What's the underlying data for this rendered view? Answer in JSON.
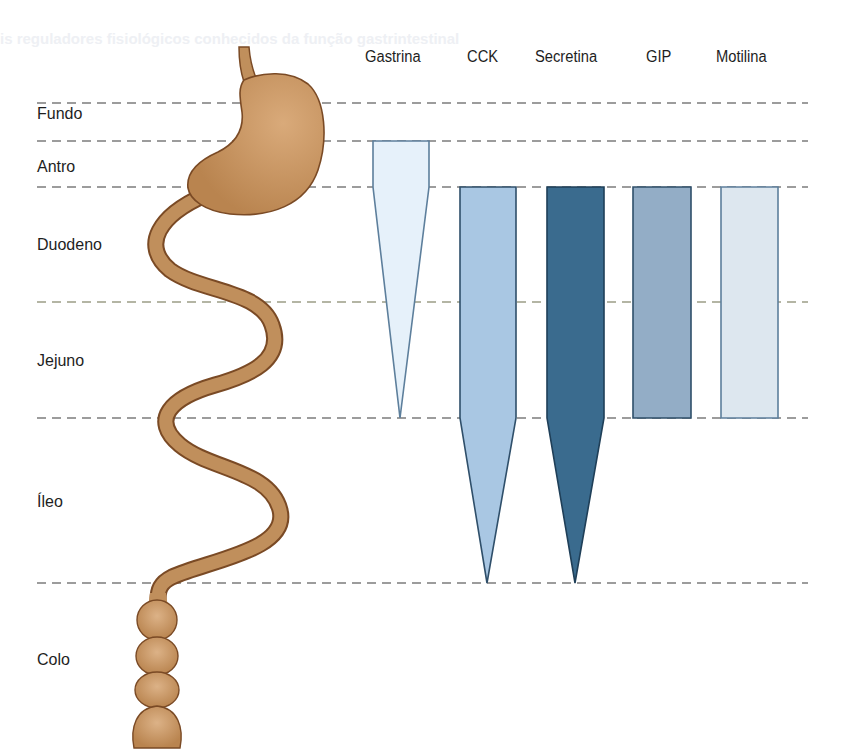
{
  "figure": {
    "regions": [
      {
        "id": "fundo",
        "label": "Fundo",
        "label_top": 106
      },
      {
        "id": "antro",
        "label": "Antro",
        "label_top": 159
      },
      {
        "id": "duodeno",
        "label": "Duodeno",
        "label_top": 237
      },
      {
        "id": "jejuno",
        "label": "Jejuno",
        "label_top": 353
      },
      {
        "id": "ileo",
        "label": "Íleo",
        "label_top": 494
      },
      {
        "id": "colo",
        "label": "Colo",
        "label_top": 652
      }
    ],
    "boundaries_y": [
      103,
      141,
      187,
      302,
      418,
      583
    ],
    "hormones": [
      {
        "id": "gastrina",
        "label": "Gastrina",
        "label_x": 365,
        "color": "#e6f1fa",
        "stroke": "#5d7f9c",
        "shape": "373,141 429,141 429,187 400,418 373,187",
        "distribution": "Antro (full) tapering through duodeno and jejuno"
      },
      {
        "id": "cck",
        "label": "CCK",
        "label_x": 467,
        "color": "#a9c7e3",
        "stroke": "#2f4f6a",
        "shape": "460,187 516,187 516,418 487,583 460,418",
        "distribution": "Duodeno and jejuno (full) tapering through íleo"
      },
      {
        "id": "secretina",
        "label": "Secretina",
        "label_x": 535,
        "color": "#3a6b8e",
        "stroke": "#1f3f58",
        "shape": "547,187 604,187 604,418 575,583 547,418",
        "distribution": "Duodeno and jejuno (full) tapering through íleo"
      },
      {
        "id": "gip",
        "label": "GIP",
        "label_x": 646,
        "color": "#93adc6",
        "stroke": "#2f4f6a",
        "shape": "633,187 691,187 691,418 633,418",
        "distribution": "Duodeno and jejuno"
      },
      {
        "id": "motilina",
        "label": "Motilina",
        "label_x": 716,
        "color": "#dde7ef",
        "stroke": "#5d7f9c",
        "shape": "721,187 778,187 778,418 721,418",
        "distribution": "Duodeno and jejuno"
      }
    ],
    "colors": {
      "organ_fill": "#c08f5c",
      "organ_outline": "#7a4a25",
      "dash_line": "#3a3a3a",
      "text": "#1e1e1e"
    },
    "ghost_text": [
      {
        "text": "is reguladores fisiológicos conhecidos da função gastrintestinal",
        "x": 0,
        "y": 30
      }
    ]
  }
}
